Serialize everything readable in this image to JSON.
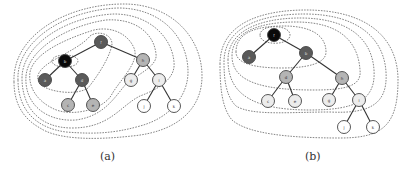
{
  "figure": {
    "panels": [
      {
        "id": "a",
        "caption": "(a)",
        "nodes": [
          {
            "id": "f",
            "label": "f",
            "x": 101,
            "y": 42,
            "shade": "dark"
          },
          {
            "id": "b",
            "label": "b",
            "x": 65,
            "y": 61,
            "shade": "black"
          },
          {
            "id": "h",
            "label": "h",
            "x": 143,
            "y": 60,
            "shade": "gray"
          },
          {
            "id": "a",
            "label": "a",
            "x": 45,
            "y": 80,
            "shade": "dark"
          },
          {
            "id": "d",
            "label": "d",
            "x": 82,
            "y": 80,
            "shade": "dark"
          },
          {
            "id": "g",
            "label": "g",
            "x": 131,
            "y": 80,
            "shade": "light"
          },
          {
            "id": "i",
            "label": "i",
            "x": 159,
            "y": 80,
            "shade": "light"
          },
          {
            "id": "c",
            "label": "c",
            "x": 68,
            "y": 105,
            "shade": "gray"
          },
          {
            "id": "e",
            "label": "e",
            "x": 93,
            "y": 105,
            "shade": "gray"
          },
          {
            "id": "j",
            "label": "j",
            "x": 144,
            "y": 106,
            "shade": "white"
          },
          {
            "id": "k",
            "label": "k",
            "x": 174,
            "y": 106,
            "shade": "white"
          }
        ],
        "edges": [
          [
            "f",
            "b"
          ],
          [
            "f",
            "h"
          ],
          [
            "b",
            "a"
          ],
          [
            "b",
            "d"
          ],
          [
            "d",
            "c"
          ],
          [
            "d",
            "e"
          ],
          [
            "h",
            "g"
          ],
          [
            "h",
            "i"
          ],
          [
            "i",
            "j"
          ],
          [
            "i",
            "k"
          ]
        ]
      },
      {
        "id": "b",
        "caption": "(b)",
        "nodes": [
          {
            "id": "f",
            "label": "f",
            "x": 274,
            "y": 35,
            "shade": "black"
          },
          {
            "id": "a",
            "label": "a",
            "x": 249,
            "y": 57,
            "shade": "dark"
          },
          {
            "id": "b",
            "label": "b",
            "x": 306,
            "y": 53,
            "shade": "dark"
          },
          {
            "id": "d",
            "label": "d",
            "x": 286,
            "y": 77,
            "shade": "gray"
          },
          {
            "id": "h",
            "label": "h",
            "x": 342,
            "y": 78,
            "shade": "gray"
          },
          {
            "id": "c",
            "label": "c",
            "x": 268,
            "y": 101,
            "shade": "light"
          },
          {
            "id": "e",
            "label": "e",
            "x": 295,
            "y": 101,
            "shade": "light"
          },
          {
            "id": "g",
            "label": "g",
            "x": 329,
            "y": 100,
            "shade": "light"
          },
          {
            "id": "i",
            "label": "i",
            "x": 359,
            "y": 100,
            "shade": "light"
          },
          {
            "id": "j",
            "label": "j",
            "x": 344,
            "y": 127,
            "shade": "white"
          },
          {
            "id": "k",
            "label": "k",
            "x": 373,
            "y": 127,
            "shade": "white"
          }
        ],
        "edges": [
          [
            "f",
            "a"
          ],
          [
            "f",
            "b"
          ],
          [
            "b",
            "d"
          ],
          [
            "b",
            "h"
          ],
          [
            "d",
            "c"
          ],
          [
            "d",
            "e"
          ],
          [
            "h",
            "g"
          ],
          [
            "h",
            "i"
          ],
          [
            "i",
            "j"
          ],
          [
            "i",
            "k"
          ]
        ]
      }
    ],
    "shade_colors": {
      "black": "#0a0a0a",
      "dark": "#5a5a5a",
      "gray": "#b4b4b4",
      "light": "#ececec",
      "white": "#ffffff"
    }
  }
}
